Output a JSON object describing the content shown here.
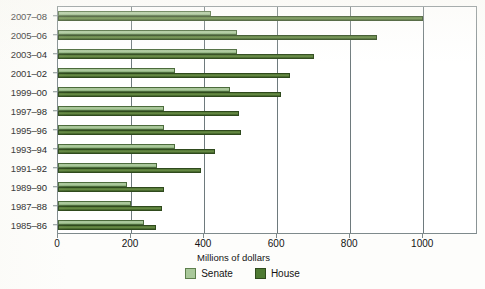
{
  "chart_data": {
    "type": "bar",
    "orientation": "horizontal",
    "title": "",
    "xlabel": "Millions of dollars",
    "ylabel": "",
    "xlim": [
      0,
      1150
    ],
    "xticks": [
      0,
      200,
      400,
      600,
      800,
      1000
    ],
    "xtick_labels": [
      "0",
      "200",
      "400",
      "600",
      "800",
      "1000"
    ],
    "grid": "vertical",
    "legend_position": "bottom-center",
    "categories": [
      "2007–08",
      "2005–06",
      "2003–04",
      "2001–02",
      "1999–00",
      "1997–98",
      "1995–96",
      "1993–94",
      "1991–92",
      "1989–90",
      "1987–88",
      "1985–86"
    ],
    "series": [
      {
        "name": "Senate",
        "color": "#a9c89a",
        "values": [
          420,
          490,
          490,
          320,
          470,
          290,
          290,
          320,
          270,
          190,
          200,
          235
        ]
      },
      {
        "name": "House",
        "color": "#4e7a33",
        "values": [
          1000,
          873,
          700,
          635,
          610,
          495,
          500,
          430,
          392,
          290,
          285,
          268
        ]
      }
    ]
  },
  "legend": {
    "items": [
      {
        "label": "Senate",
        "swatch": "senate-swatch"
      },
      {
        "label": "House",
        "swatch": "house-swatch"
      }
    ]
  },
  "axis": {
    "x_title": "Millions of dollars"
  }
}
